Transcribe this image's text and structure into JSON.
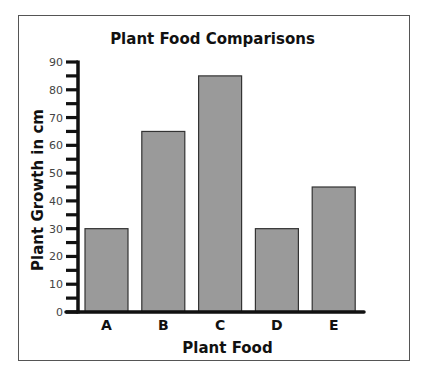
{
  "chart_data": {
    "type": "bar",
    "title": "Plant Food Comparisons",
    "xlabel": "Plant Food",
    "ylabel": "Plant Growth in cm",
    "categories": [
      "A",
      "B",
      "C",
      "D",
      "E"
    ],
    "values": [
      30,
      65,
      85,
      30,
      45
    ],
    "ylim": [
      0,
      90
    ],
    "yticks": [
      0,
      10,
      20,
      30,
      40,
      50,
      60,
      70,
      80,
      90
    ],
    "minor_tick_step": 5,
    "grid": false,
    "legend": null,
    "bar_color": "#9a9a9a",
    "bar_edge_color": "#333333"
  }
}
